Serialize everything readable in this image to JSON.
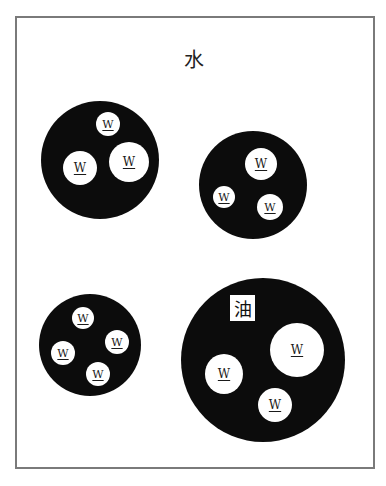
{
  "diagram": {
    "outer_phase_label": "水",
    "inner_phase_label": "油",
    "droplet_label": "W",
    "colors": {
      "oil_phase": "#0c0c0c",
      "water_phase": "#ffffff",
      "frame": "#7a7a7a"
    },
    "globules": [
      {
        "id": "globule-top-left",
        "cx": 100,
        "cy": 160,
        "r": 59,
        "droplets": [
          {
            "cx": 108,
            "cy": 124,
            "r": 12
          },
          {
            "cx": 80,
            "cy": 168,
            "r": 17
          },
          {
            "cx": 129,
            "cy": 162,
            "r": 20
          }
        ]
      },
      {
        "id": "globule-top-right",
        "cx": 253,
        "cy": 185,
        "r": 54,
        "droplets": [
          {
            "cx": 261,
            "cy": 164,
            "r": 16
          },
          {
            "cx": 224,
            "cy": 197,
            "r": 11
          },
          {
            "cx": 270,
            "cy": 207,
            "r": 13
          }
        ]
      },
      {
        "id": "globule-bottom-left",
        "cx": 90,
        "cy": 345,
        "r": 51,
        "droplets": [
          {
            "cx": 83,
            "cy": 318,
            "r": 11
          },
          {
            "cx": 117,
            "cy": 342,
            "r": 12
          },
          {
            "cx": 63,
            "cy": 353,
            "r": 12
          },
          {
            "cx": 98,
            "cy": 374,
            "r": 12
          }
        ]
      },
      {
        "id": "globule-bottom-right",
        "cx": 263,
        "cy": 360,
        "r": 82,
        "has_oil_label": true,
        "droplets": [
          {
            "cx": 297,
            "cy": 350,
            "r": 27
          },
          {
            "cx": 224,
            "cy": 373,
            "r": 19
          },
          {
            "cx": 275,
            "cy": 405,
            "r": 17
          }
        ]
      }
    ]
  }
}
